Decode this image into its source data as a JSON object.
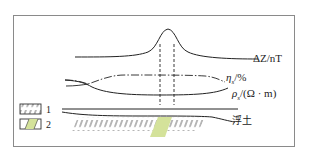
{
  "diagram": {
    "curves": [
      {
        "id": "magnetic",
        "label": "ΔZ/nT",
        "style": "solid"
      },
      {
        "id": "polarizability",
        "label_symbol": "η",
        "label_sub": "s",
        "label_unit": "/%",
        "style": "dash-dot"
      },
      {
        "id": "resistivity",
        "label_symbol": "ρ",
        "label_sub": "s",
        "label_unit": "/(Ω · m)",
        "style": "solid"
      }
    ],
    "section": {
      "overburden_label": "浮土"
    },
    "legend": [
      {
        "number": "1",
        "pattern": "hatch",
        "fill": "#ffffff"
      },
      {
        "number": "2",
        "pattern": "hatch",
        "fill": "#d4e29a"
      }
    ],
    "colors": {
      "ore_body": "#d4e29a",
      "line": "#222222",
      "frame": "#8a8a8a"
    }
  }
}
